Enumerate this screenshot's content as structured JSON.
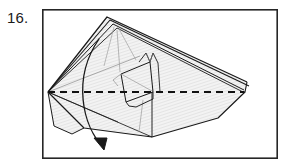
{
  "page": {
    "background_color": "#ffffff",
    "width": 288,
    "height": 165
  },
  "step": {
    "number_label": "16.",
    "text_color": "#1a1a1a"
  },
  "frame": {
    "name": "figure-border",
    "x": 42,
    "y": 9,
    "width": 236,
    "height": 150,
    "stroke_color": "#262626",
    "stroke_width": 1.6,
    "fill_color": "#ffffff"
  },
  "diagram": {
    "type": "origami-fold-step",
    "fill_color": "#f0f0f0",
    "hatch_color": "#d0d0d0",
    "line_color": "#1a1a1a",
    "soft_line_color": "#808080",
    "dashed_line": {
      "name": "valley-fold-axis",
      "x1": 48,
      "y1": 92,
      "x2": 244,
      "y2": 92,
      "dash_pattern": "7 5",
      "stroke_width": 2.0,
      "color": "#111111"
    },
    "apex_left": {
      "x": 48,
      "y": 92
    },
    "apex_right": {
      "x": 245,
      "y": 92
    },
    "peak_top": {
      "x": 115,
      "y": 18
    },
    "arrow": {
      "name": "fold-direction-arrow",
      "start": {
        "x": 99,
        "y": 39
      },
      "control1": {
        "x": 72,
        "y": 78
      },
      "control2": {
        "x": 82,
        "y": 126
      },
      "end": {
        "x": 104,
        "y": 148
      },
      "head_length": 11,
      "stroke_width": 1.3,
      "color": "#1a1a1a"
    }
  }
}
